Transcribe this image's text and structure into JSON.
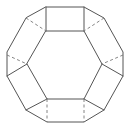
{
  "diagram": {
    "type": "polyhedron-wireframe",
    "stroke_color": "#555555",
    "dashed_color": "#777777",
    "background": "#ffffff",
    "vertices": {
      "outer_top_left": [
        46,
        7
      ],
      "outer_top_right": [
        84,
        7
      ],
      "outer_upper_right": [
        104,
        18
      ],
      "outer_right_top": [
        123,
        52
      ],
      "outer_right_bottom": [
        123,
        76
      ],
      "outer_lower_right": [
        104,
        110
      ],
      "outer_bottom_right": [
        84,
        122
      ],
      "outer_bottom_left": [
        47,
        122
      ],
      "outer_lower_left": [
        26,
        110
      ],
      "outer_left_bottom": [
        7,
        76
      ],
      "outer_left_top": [
        7,
        52
      ],
      "outer_upper_left": [
        26,
        18
      ],
      "inner_top_left": [
        46,
        31
      ],
      "inner_top_right": [
        84,
        31
      ],
      "inner_right": [
        102,
        64
      ],
      "inner_bottom_right": [
        84,
        99
      ],
      "inner_bottom_left": [
        47,
        99
      ],
      "inner_left": [
        27,
        64
      ]
    }
  }
}
